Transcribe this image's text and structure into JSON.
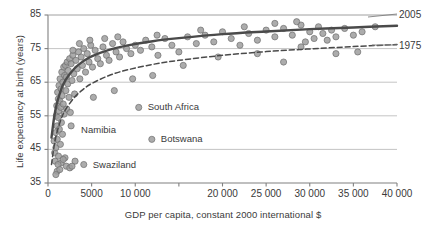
{
  "chart_data": {
    "type": "scatter",
    "title": "",
    "subtitle": "",
    "xlabel": "GDP per capita, constant 2000 international $",
    "ylabel": "Life expectancy at birth (years)",
    "xlim": [
      0,
      40000
    ],
    "ylim": [
      35,
      85
    ],
    "xticks": [
      0,
      5000,
      10000,
      15000,
      20000,
      25000,
      30000,
      35000,
      40000
    ],
    "xtick_labels": [
      "0",
      "5000",
      "10 000",
      "15 000",
      "20 000",
      "25 000",
      "30 000",
      "35 000",
      "40 000"
    ],
    "yticks": [
      35,
      45,
      55,
      65,
      75,
      85
    ],
    "ytick_labels": [
      "35",
      "45",
      "55",
      "65",
      "75",
      "85"
    ],
    "grid": "horizontal",
    "legend_position": "right-inline",
    "marker": {
      "shape": "circle",
      "fill": "#9d9d9d",
      "stroke": "#6e6e6e",
      "radius": 3.1,
      "opacity": 0.85
    },
    "series": [
      {
        "name": "countries",
        "kind": "scatter",
        "points": [
          [
            700,
            47.5
          ],
          [
            760,
            44.0
          ],
          [
            820,
            41.5
          ],
          [
            880,
            50.0
          ],
          [
            900,
            45.5
          ],
          [
            950,
            55.0
          ],
          [
            1000,
            58.0
          ],
          [
            1030,
            52.0
          ],
          [
            1060,
            48.0
          ],
          [
            1100,
            62.0
          ],
          [
            1150,
            54.5
          ],
          [
            1180,
            60.0
          ],
          [
            1200,
            43.0
          ],
          [
            1230,
            56.5
          ],
          [
            1260,
            64.0
          ],
          [
            1300,
            51.0
          ],
          [
            1340,
            59.5
          ],
          [
            1380,
            66.0
          ],
          [
            1420,
            46.5
          ],
          [
            1460,
            57.5
          ],
          [
            1500,
            63.0
          ],
          [
            1540,
            53.0
          ],
          [
            1580,
            68.0
          ],
          [
            1620,
            61.0
          ],
          [
            1660,
            49.5
          ],
          [
            1700,
            65.0
          ],
          [
            1750,
            58.5
          ],
          [
            1800,
            69.5
          ],
          [
            1850,
            55.5
          ],
          [
            1900,
            67.0
          ],
          [
            1950,
            42.5
          ],
          [
            2000,
            70.0
          ],
          [
            2050,
            62.5
          ],
          [
            2100,
            66.5
          ],
          [
            2150,
            57.0
          ],
          [
            2200,
            71.0
          ],
          [
            2260,
            64.5
          ],
          [
            2320,
            68.5
          ],
          [
            2400,
            60.5
          ],
          [
            2480,
            72.0
          ],
          [
            2560,
            56.0
          ],
          [
            2650,
            70.5
          ],
          [
            2750,
            65.5
          ],
          [
            2850,
            73.0
          ],
          [
            2950,
            67.5
          ],
          [
            3050,
            61.5
          ],
          [
            3200,
            71.5
          ],
          [
            3350,
            69.0
          ],
          [
            3500,
            74.0
          ],
          [
            3650,
            66.0
          ],
          [
            3800,
            72.5
          ],
          [
            3950,
            70.0
          ],
          [
            4100,
            75.0
          ],
          [
            4300,
            68.0
          ],
          [
            4500,
            73.5
          ],
          [
            4700,
            71.0
          ],
          [
            4900,
            76.0
          ],
          [
            5100,
            69.5
          ],
          [
            5400,
            74.5
          ],
          [
            5700,
            72.0
          ],
          [
            6000,
            70.5
          ],
          [
            6300,
            75.5
          ],
          [
            6700,
            73.0
          ],
          [
            7000,
            71.5
          ],
          [
            7400,
            76.5
          ],
          [
            7800,
            74.0
          ],
          [
            8200,
            72.5
          ],
          [
            8600,
            77.0
          ],
          [
            9000,
            75.0
          ],
          [
            9500,
            73.5
          ],
          [
            10000,
            76.0
          ],
          [
            10600,
            74.5
          ],
          [
            11200,
            77.5
          ],
          [
            11900,
            75.5
          ],
          [
            12600,
            73.0
          ],
          [
            13400,
            78.0
          ],
          [
            14200,
            76.0
          ],
          [
            15000,
            74.0
          ],
          [
            16000,
            78.5
          ],
          [
            17000,
            76.5
          ],
          [
            18000,
            79.0
          ],
          [
            19000,
            77.0
          ],
          [
            20000,
            80.0
          ],
          [
            21000,
            78.0
          ],
          [
            22000,
            76.0
          ],
          [
            23000,
            79.5
          ],
          [
            24000,
            77.5
          ],
          [
            25000,
            80.5
          ],
          [
            26000,
            78.5
          ],
          [
            27000,
            81.0
          ],
          [
            28000,
            79.0
          ],
          [
            29000,
            82.0
          ],
          [
            29500,
            77.0
          ],
          [
            30000,
            80.0
          ],
          [
            30500,
            78.0
          ],
          [
            31000,
            81.5
          ],
          [
            31500,
            79.5
          ],
          [
            32000,
            77.5
          ],
          [
            32500,
            80.5
          ],
          [
            33000,
            78.5
          ],
          [
            34000,
            81.0
          ],
          [
            35000,
            79.0
          ],
          [
            36000,
            80.0
          ],
          [
            37500,
            81.5
          ],
          [
            29000,
            75.5
          ],
          [
            2100,
            40.0
          ],
          [
            2500,
            39.5
          ],
          [
            1500,
            41.0
          ],
          [
            1150,
            40.5
          ],
          [
            1750,
            42.0
          ],
          [
            1050,
            38.5
          ],
          [
            3100,
            41.5
          ],
          [
            1350,
            39.0
          ],
          [
            900,
            37.5
          ],
          [
            2750,
            40.0
          ],
          [
            5200,
            60.5
          ],
          [
            7600,
            62.5
          ],
          [
            9700,
            66.0
          ],
          [
            12000,
            67.0
          ],
          [
            15500,
            70.0
          ],
          [
            19500,
            72.5
          ],
          [
            24000,
            73.5
          ],
          [
            27000,
            71.0
          ],
          [
            35500,
            74.0
          ],
          [
            33000,
            73.5
          ],
          [
            6500,
            78.0
          ],
          [
            8000,
            78.5
          ],
          [
            12500,
            79.0
          ],
          [
            17500,
            80.5
          ],
          [
            22500,
            81.5
          ],
          [
            26000,
            82.5
          ],
          [
            28500,
            83.0
          ],
          [
            4800,
            77.5
          ],
          [
            3600,
            76.5
          ],
          [
            2850,
            74.5
          ]
        ]
      },
      {
        "name": "2005",
        "kind": "fit-curve",
        "style": "solid",
        "color": "#4a4a4a",
        "width": 2.4,
        "model": "a + b*ln(x)",
        "points": [
          [
            400,
            48.5
          ],
          [
            700,
            54.5
          ],
          [
            1000,
            58.5
          ],
          [
            1500,
            62.8
          ],
          [
            2000,
            65.6
          ],
          [
            3000,
            69.0
          ],
          [
            4000,
            71.2
          ],
          [
            5000,
            72.7
          ],
          [
            7000,
            74.6
          ],
          [
            9000,
            75.9
          ],
          [
            12000,
            77.2
          ],
          [
            15000,
            78.1
          ],
          [
            20000,
            79.3
          ],
          [
            25000,
            80.1
          ],
          [
            30000,
            80.8
          ],
          [
            35000,
            81.3
          ],
          [
            40000,
            81.8
          ]
        ]
      },
      {
        "name": "1975",
        "kind": "fit-curve",
        "style": "dashed",
        "color": "#4a4a4a",
        "width": 1.5,
        "dash": "5,3",
        "model": "a + b*ln(x)",
        "points": [
          [
            400,
            40.5
          ],
          [
            700,
            46.0
          ],
          [
            1000,
            49.8
          ],
          [
            1500,
            54.0
          ],
          [
            2000,
            56.8
          ],
          [
            3000,
            60.4
          ],
          [
            4000,
            62.8
          ],
          [
            5000,
            64.6
          ],
          [
            7000,
            67.0
          ],
          [
            9000,
            68.6
          ],
          [
            12000,
            70.3
          ],
          [
            15000,
            71.5
          ],
          [
            20000,
            73.0
          ],
          [
            25000,
            74.1
          ],
          [
            30000,
            74.9
          ],
          [
            35000,
            75.6
          ],
          [
            40000,
            76.2
          ]
        ]
      }
    ],
    "annotations": [
      {
        "name": "Namibia",
        "label": "Namibia",
        "x": 2650,
        "y": 52.0,
        "label_dx": 10,
        "label_dy": 5
      },
      {
        "name": "South Africa",
        "label": "South Africa",
        "x": 10400,
        "y": 57.5,
        "label_dx": 9,
        "label_dy": 1
      },
      {
        "name": "Botswana",
        "label": "Botswana",
        "x": 11900,
        "y": 48.0,
        "label_dx": 9,
        "label_dy": 1
      },
      {
        "name": "Swaziland",
        "label": "Swaziland",
        "x": 4100,
        "y": 40.5,
        "label_dx": 9,
        "label_dy": 1
      }
    ],
    "series_labels": [
      {
        "name": "2005",
        "label": "2005",
        "x_px": 399,
        "y_px": 9
      },
      {
        "name": "1975",
        "label": "1975",
        "x_px": 399,
        "y_px": 40
      }
    ]
  },
  "colors": {
    "axis": "#808080",
    "grid": "#b5b5b5",
    "text": "#3a3a3a",
    "marker_fill": "#9d9d9d",
    "marker_stroke": "#6e6e6e",
    "curve": "#4a4a4a",
    "background": "#ffffff"
  }
}
